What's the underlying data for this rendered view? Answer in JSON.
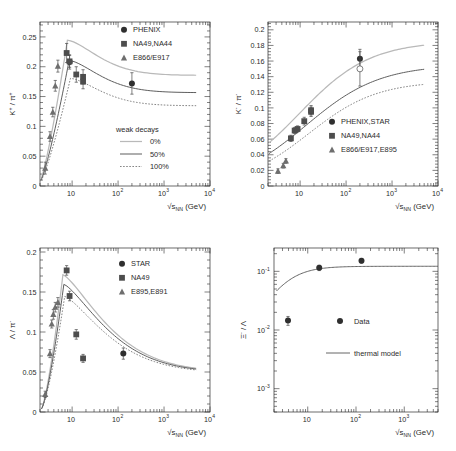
{
  "figure": {
    "title": "",
    "layout": "2x2 grid of particle ratio excitation functions"
  },
  "chart_data": [
    {
      "id": "panel-kplus-piplus",
      "type": "scatter",
      "title": "",
      "xlabel": "√s_NN (GeV)",
      "xlabel_pretty": "√s",
      "xlabel_sub": "NN",
      "xlabel_unit": "(GeV)",
      "ylabel": "K+ / π+",
      "xscale": "log",
      "xlim": [
        2,
        10000
      ],
      "ylim": [
        0,
        0.275
      ],
      "yticks": [
        0,
        0.05,
        0.1,
        0.15,
        0.2,
        0.25
      ],
      "yticklabels": [
        "0",
        "0.05",
        "0.1",
        "0.15",
        "0.2",
        "0.25"
      ],
      "xticks": [
        10,
        100,
        1000,
        10000
      ],
      "xticklabels": [
        "10",
        "10",
        "10",
        "10"
      ],
      "xtick_sups": [
        "",
        "2",
        "3",
        "4"
      ],
      "grid": false,
      "legend_position": "top-right",
      "legend": [
        {
          "label": "PHENIX",
          "marker": "circle"
        },
        {
          "label": "NA49,NA44",
          "marker": "square"
        },
        {
          "label": "E866/E917",
          "marker": "triangle"
        }
      ],
      "legend2_title": "weak decays",
      "legend2": [
        {
          "label": "0%",
          "style": "solid-light"
        },
        {
          "label": "50%",
          "style": "solid-dark"
        },
        {
          "label": "100%",
          "style": "dotted"
        }
      ],
      "series": [
        {
          "name": "PHENIX",
          "marker": "circle",
          "points": [
            [
              8.8,
              0.208,
              0.012
            ],
            [
              200,
              0.172,
              0.018
            ]
          ]
        },
        {
          "name": "NA49,NA44",
          "marker": "square",
          "points": [
            [
              7.6,
              0.223,
              0.016
            ],
            [
              8.8,
              0.209,
              0.01
            ],
            [
              12.3,
              0.187,
              0.013
            ],
            [
              17.3,
              0.183,
              0.012
            ],
            [
              17.3,
              0.175,
              0.012
            ]
          ]
        },
        {
          "name": "E866/E917",
          "marker": "triangle",
          "points": [
            [
              2.6,
              0.03,
              0.01
            ],
            [
              3.3,
              0.083,
              0.008
            ],
            [
              3.8,
              0.124,
              0.008
            ],
            [
              4.3,
              0.168,
              0.009
            ],
            [
              4.9,
              0.201,
              0.01
            ]
          ]
        }
      ],
      "curves": [
        {
          "name": "0%",
          "style": "solid-light"
        },
        {
          "name": "50%",
          "style": "solid-dark"
        },
        {
          "name": "100%",
          "style": "dotted"
        }
      ]
    },
    {
      "id": "panel-kminus-piminus",
      "type": "scatter",
      "title": "",
      "xlabel": "√s_NN (GeV)",
      "xlabel_pretty": "√s",
      "xlabel_sub": "NN",
      "xlabel_unit": "(GeV)",
      "ylabel": "K- / π-",
      "xscale": "log",
      "xlim": [
        2,
        10000
      ],
      "ylim": [
        0,
        0.21
      ],
      "yticks": [
        0,
        0.02,
        0.04,
        0.06,
        0.08,
        0.1,
        0.12,
        0.14,
        0.16,
        0.18,
        0.2
      ],
      "yticklabels": [
        "0",
        "0.02",
        "0.04",
        "0.06",
        "0.08",
        "0.1",
        "0.12",
        "0.14",
        "0.16",
        "0.18",
        "0.2"
      ],
      "xticks": [
        10,
        100,
        1000,
        10000
      ],
      "xticklabels": [
        "10",
        "10",
        "10",
        "10"
      ],
      "xtick_sups": [
        "",
        "2",
        "3",
        "4"
      ],
      "grid": false,
      "legend_position": "bottom-right",
      "legend": [
        {
          "label": "PHENIX,STAR",
          "marker": "circle"
        },
        {
          "label": "NA49,NA44",
          "marker": "square"
        },
        {
          "label": "E866/E917,E895",
          "marker": "triangle"
        }
      ],
      "series": [
        {
          "name": "PHENIX,STAR",
          "marker": "circle",
          "points": [
            [
              200,
              0.163,
              0.012
            ]
          ]
        },
        {
          "name": "PHENIX,STAR-open",
          "marker": "open-circle",
          "points": [
            [
              200,
              0.15,
              0.022
            ]
          ]
        },
        {
          "name": "NA49,NA44",
          "marker": "square",
          "points": [
            [
              6.3,
              0.061,
              0.004
            ],
            [
              7.6,
              0.071,
              0.004
            ],
            [
              8.8,
              0.073,
              0.004
            ],
            [
              12.3,
              0.083,
              0.005
            ],
            [
              17.3,
              0.095,
              0.006
            ],
            [
              17.3,
              0.097,
              0.006
            ]
          ]
        },
        {
          "name": "E866/E917,E895",
          "marker": "triangle",
          "points": [
            [
              3.3,
              0.019,
              0.003
            ],
            [
              4.3,
              0.026,
              0.003
            ],
            [
              4.9,
              0.032,
              0.003
            ]
          ]
        }
      ],
      "curves": [
        {
          "name": "0%",
          "style": "solid-light"
        },
        {
          "name": "50%",
          "style": "solid-dark"
        },
        {
          "name": "100%",
          "style": "dotted"
        }
      ]
    },
    {
      "id": "panel-lambda-piminus",
      "type": "scatter",
      "title": "",
      "xlabel": "√s_NN (GeV)",
      "xlabel_pretty": "√s",
      "xlabel_sub": "NN",
      "xlabel_unit": "(GeV)",
      "ylabel": "Λ / π-",
      "xscale": "log",
      "xlim": [
        2,
        10000
      ],
      "ylim": [
        0,
        0.205
      ],
      "yticks": [
        0,
        0.05,
        0.1,
        0.15,
        0.2
      ],
      "yticklabels": [
        "0",
        "0.05",
        "0.1",
        "0.15",
        "0.2"
      ],
      "xticks": [
        10,
        100,
        1000,
        10000
      ],
      "xticklabels": [
        "10",
        "10",
        "10",
        "10"
      ],
      "xtick_sups": [
        "",
        "2",
        "3",
        "4"
      ],
      "grid": false,
      "legend_position": "top-right",
      "legend": [
        {
          "label": "STAR",
          "marker": "circle"
        },
        {
          "label": "NA49",
          "marker": "square"
        },
        {
          "label": "E895,E891",
          "marker": "triangle"
        }
      ],
      "series": [
        {
          "name": "STAR",
          "marker": "circle",
          "points": [
            [
              130,
              0.073,
              0.007
            ]
          ]
        },
        {
          "name": "NA49",
          "marker": "square",
          "points": [
            [
              7.6,
              0.177,
              0.006
            ],
            [
              8.8,
              0.145,
              0.006
            ],
            [
              12.3,
              0.097,
              0.006
            ],
            [
              17.3,
              0.067,
              0.005
            ]
          ]
        },
        {
          "name": "E895,E891",
          "marker": "triangle",
          "points": [
            [
              2.6,
              0.022,
              0.004
            ],
            [
              3.3,
              0.073,
              0.005
            ],
            [
              3.6,
              0.11,
              0.005
            ],
            [
              3.9,
              0.122,
              0.006
            ],
            [
              4.3,
              0.131,
              0.006
            ],
            [
              4.9,
              0.137,
              0.006
            ]
          ]
        }
      ],
      "curves": [
        {
          "name": "0%",
          "style": "solid-light"
        },
        {
          "name": "50%",
          "style": "solid-dark"
        },
        {
          "name": "100%",
          "style": "dotted"
        }
      ]
    },
    {
      "id": "panel-xi-lambda",
      "type": "scatter",
      "title": "",
      "xlabel": "√s_NN (GeV)",
      "xlabel_pretty": "√s",
      "xlabel_sub": "NN",
      "xlabel_unit": "(GeV)",
      "ylabel": "Ξ- / Λ",
      "xscale": "log",
      "yscale": "log",
      "xlim": [
        2,
        5000
      ],
      "ylim": [
        0.0004,
        0.25
      ],
      "yticklabels": [
        "10",
        "10",
        "10"
      ],
      "ytick_sups": [
        "-1",
        "-2",
        "-3"
      ],
      "xticks": [
        10,
        100,
        1000
      ],
      "xticklabels": [
        "10",
        "10",
        "10"
      ],
      "xtick_sups": [
        "",
        "2",
        "3"
      ],
      "grid": false,
      "legend_position": "center-right",
      "legend": [
        {
          "label": "Data",
          "marker": "circle"
        },
        {
          "label": "thermal model",
          "marker": "line"
        }
      ],
      "series": [
        {
          "name": "Data",
          "marker": "circle",
          "points": [
            [
              3.9,
              0.0145,
              0.0025
            ],
            [
              17.3,
              0.115,
              0.012
            ],
            [
              130,
              0.152,
              0.014
            ]
          ]
        }
      ],
      "curves": [
        {
          "name": "thermal model",
          "style": "solid-dark"
        }
      ]
    }
  ],
  "colors": {
    "curve_0pct": "#b9b9b9",
    "curve_50pct": "#555555",
    "curve_100pct": "#666666",
    "marker_circle": "#2f2f2f",
    "marker_square": "#4d4d4d",
    "marker_triangle": "#6e6e6e",
    "axis": "#2b2b2b"
  }
}
